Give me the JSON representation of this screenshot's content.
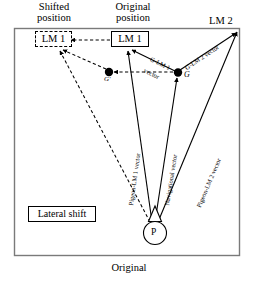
{
  "figure": {
    "caption": "Original",
    "headers": {
      "shifted": "Shifted\nposition",
      "original": "Original\nposition"
    },
    "landmarks": {
      "lm1_shifted": "LM 1",
      "lm1_original": "LM 1",
      "lm2": "LM 2"
    },
    "goals": {
      "g": "G",
      "g_prime": "G'"
    },
    "pigeon": {
      "label": "P"
    },
    "annotations": {
      "lateral_shift": "Lateral shift"
    },
    "vectors": [
      {
        "id": "g-lm1",
        "label_line1": "G-LM 1",
        "label_line2": "vector"
      },
      {
        "id": "g-lm2",
        "label_line1": "G-LM 2 vector",
        "label_line2": ""
      },
      {
        "id": "pigeon-lm1",
        "label_line1": "Pigeon-LM 1 vector",
        "label_line2": ""
      },
      {
        "id": "navigational",
        "label_line1": "Navigational vector",
        "label_line2": ""
      },
      {
        "id": "pigeon-lm2",
        "label_line1": "Pigeon-LM 2 vector",
        "label_line2": ""
      }
    ],
    "colors": {
      "stroke": "#000000",
      "frame": "#808080",
      "background": "#ffffff"
    }
  }
}
